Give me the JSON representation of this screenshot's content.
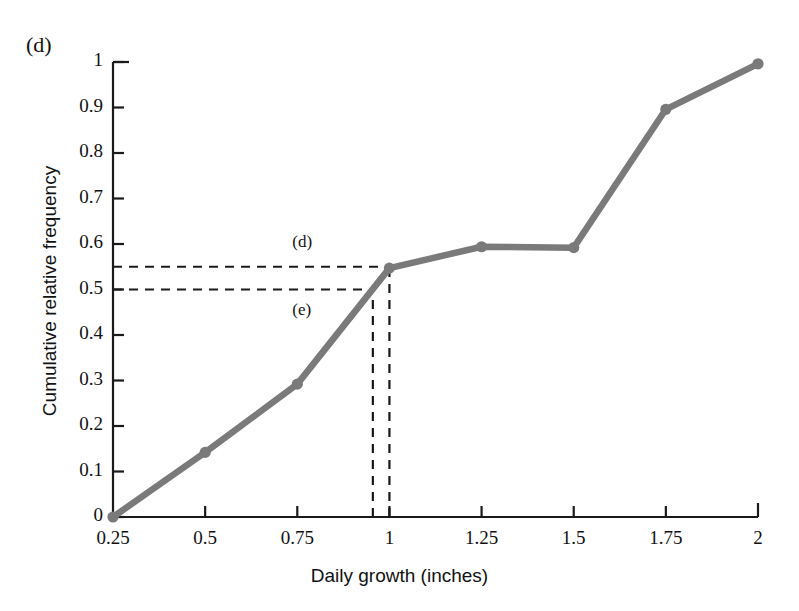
{
  "panel": {
    "label": "(d)"
  },
  "axes": {
    "x_title": "Daily growth (inches)",
    "y_title": "Cumulative relative frequency",
    "x_ticks": [
      "0.25",
      "0.5",
      "0.75",
      "1",
      "1.25",
      "1.5",
      "1.75",
      "2"
    ],
    "y_ticks": [
      "0",
      "0.1",
      "0.2",
      "0.3",
      "0.4",
      "0.5",
      "0.6",
      "0.7",
      "0.8",
      "0.9",
      "1"
    ]
  },
  "annotations": {
    "d_label": "(d)",
    "e_label": "(e)"
  },
  "colors": {
    "line": "#7a7a7a",
    "axis": "#1a1a1a",
    "guide": "#1a1a1a",
    "background": "#ffffff"
  },
  "chart_data": {
    "type": "line",
    "title": "",
    "subtitle": "",
    "xlabel": "Daily growth (inches)",
    "ylabel": "Cumulative relative frequency",
    "xlim": [
      0.25,
      2
    ],
    "ylim": [
      0,
      1
    ],
    "grid": false,
    "legend": "none",
    "x": [
      0.25,
      0.5,
      0.75,
      1,
      1.25,
      1.5,
      1.75,
      2
    ],
    "values": [
      0,
      0.142,
      0.292,
      0.547,
      0.594,
      0.592,
      0.896,
      0.996
    ],
    "markers": true,
    "marker_shape": "circle",
    "x_tick_labels": [
      "0.25",
      "0.5",
      "0.75",
      "1",
      "1.25",
      "1.5",
      "1.75",
      "2"
    ],
    "y_tick_labels": [
      "0",
      "0.1",
      "0.2",
      "0.3",
      "0.4",
      "0.5",
      "0.6",
      "0.7",
      "0.8",
      "0.9",
      "1"
    ],
    "y_tick_values": [
      0,
      0.1,
      0.2,
      0.3,
      0.4,
      0.5,
      0.6,
      0.7,
      0.8,
      0.9,
      1
    ],
    "annotations": [
      {
        "name": "d",
        "label": "(d)",
        "type": "horizontal-dashed-to-curve",
        "y": 0.55,
        "x_intersect": 1.0,
        "label_x": 0.78,
        "label_y": 0.6
      },
      {
        "name": "e",
        "label": "(e)",
        "type": "horizontal-dashed-to-curve",
        "y": 0.5,
        "x_intersect": 0.955,
        "label_x": 0.78,
        "label_y": 0.45
      }
    ],
    "dropline_x": [
      0.955,
      1.0
    ]
  }
}
